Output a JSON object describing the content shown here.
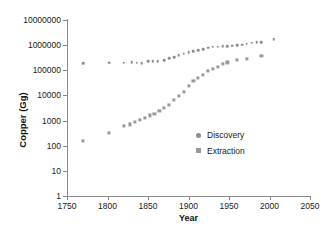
{
  "chart_data": {
    "type": "scatter",
    "title": "",
    "xlabel": "Year",
    "ylabel": "Copper (Gg)",
    "xlim": [
      1750,
      2050
    ],
    "ylim": [
      1,
      10000000
    ],
    "yscale": "log",
    "grid": false,
    "legend_position": "inside-right",
    "xticks": [
      1750,
      1800,
      1850,
      1900,
      1950,
      2000,
      2050
    ],
    "xtick_labels": [
      "1750",
      "1800",
      "1850",
      "1900",
      "1950",
      "2000",
      "2050"
    ],
    "yticks": [
      1,
      10,
      100,
      1000,
      10000,
      100000,
      1000000,
      10000000
    ],
    "ytick_labels": [
      "1",
      "10",
      "100",
      "1000",
      "10000",
      "100000",
      "1000000",
      "10000000"
    ],
    "series": [
      {
        "name": "Discovery",
        "marker": "circle",
        "color": "#8c8c8c",
        "points": [
          [
            1770,
            190000
          ],
          [
            1802,
            200000
          ],
          [
            1820,
            200000
          ],
          [
            1830,
            205000
          ],
          [
            1836,
            200000
          ],
          [
            1842,
            195000
          ],
          [
            1850,
            235000
          ],
          [
            1856,
            230000
          ],
          [
            1862,
            225000
          ],
          [
            1870,
            250000
          ],
          [
            1876,
            300000
          ],
          [
            1882,
            340000
          ],
          [
            1888,
            400000
          ],
          [
            1894,
            460000
          ],
          [
            1900,
            520000
          ],
          [
            1906,
            560000
          ],
          [
            1912,
            620000
          ],
          [
            1918,
            700000
          ],
          [
            1924,
            790000
          ],
          [
            1930,
            860000
          ],
          [
            1936,
            880000
          ],
          [
            1942,
            900000
          ],
          [
            1948,
            930000
          ],
          [
            1954,
            960000
          ],
          [
            1960,
            1000000
          ],
          [
            1966,
            1050000
          ],
          [
            1972,
            1150000
          ],
          [
            1978,
            1250000
          ],
          [
            1984,
            1300000
          ],
          [
            1990,
            1330000
          ],
          [
            2005,
            1700000
          ]
        ]
      },
      {
        "name": "Extraction",
        "marker": "square",
        "color": "#9a9a9a",
        "points": [
          [
            1770,
            150
          ],
          [
            1802,
            320
          ],
          [
            1820,
            620
          ],
          [
            1828,
            700
          ],
          [
            1834,
            900
          ],
          [
            1840,
            1100
          ],
          [
            1846,
            1250
          ],
          [
            1852,
            1600
          ],
          [
            1858,
            1900
          ],
          [
            1864,
            2500
          ],
          [
            1870,
            3200
          ],
          [
            1876,
            4200
          ],
          [
            1882,
            6500
          ],
          [
            1888,
            9500
          ],
          [
            1894,
            14000
          ],
          [
            1900,
            24000
          ],
          [
            1906,
            38000
          ],
          [
            1912,
            50000
          ],
          [
            1918,
            65000
          ],
          [
            1924,
            95000
          ],
          [
            1930,
            110000
          ],
          [
            1936,
            140000
          ],
          [
            1942,
            180000
          ],
          [
            1948,
            205000
          ],
          [
            1960,
            250000
          ],
          [
            1972,
            290000
          ],
          [
            1990,
            370000
          ]
        ]
      }
    ]
  },
  "legend": {
    "items": [
      {
        "label": "Discovery",
        "marker": "circle"
      },
      {
        "label": "Extraction",
        "marker": "square"
      }
    ]
  }
}
